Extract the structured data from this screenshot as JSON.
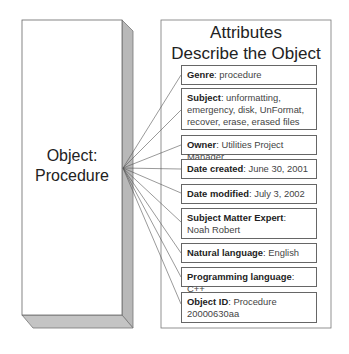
{
  "object": {
    "label_line1": "Object:",
    "label_line2": "Procedure"
  },
  "panel": {
    "title_line1": "Attributes",
    "title_line2": "Describe the Object"
  },
  "attributes": [
    {
      "key": "Genre",
      "value": "procedure"
    },
    {
      "key": "Subject",
      "value": "unformatting, emergency, disk, UnFormat, recover, erase, erased files"
    },
    {
      "key": "Owner",
      "value": "Utilities Project Manager"
    },
    {
      "key": "Date created",
      "value": "June 30, 2001"
    },
    {
      "key": "Date modified",
      "value": "July 3, 2002"
    },
    {
      "key": "Subject Matter Expert",
      "value": "Noah Robert"
    },
    {
      "key": "Natural language",
      "value": "English"
    },
    {
      "key": "Programming language",
      "value": "C++"
    },
    {
      "key": "Object ID",
      "value": "Procedure 20000630aa"
    }
  ],
  "colors": {
    "outline": "#666666",
    "side_shade": "#b5b5b5",
    "bottom_shade": "#c2c2c2",
    "connector": "#555555"
  }
}
